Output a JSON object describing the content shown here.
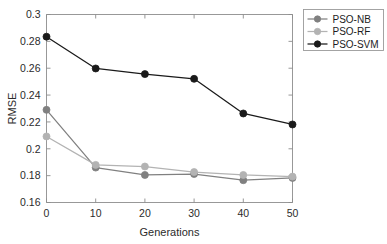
{
  "chart_data": {
    "type": "line",
    "title": "",
    "xlabel": "Generations",
    "ylabel": "RMSE",
    "x": [
      0,
      10,
      20,
      30,
      40,
      50
    ],
    "xlim": [
      0,
      50
    ],
    "ylim": [
      0.16,
      0.3
    ],
    "xticks": [
      0,
      10,
      20,
      30,
      40,
      50
    ],
    "xticklabels": [
      "0",
      "10",
      "20",
      "30",
      "40",
      "50"
    ],
    "yticks": [
      0.16,
      0.18,
      0.2,
      0.22,
      0.24,
      0.26,
      0.28,
      0.3
    ],
    "yticklabels": [
      "0.16",
      "0.18",
      "0.2",
      "0.22",
      "0.24",
      "0.26",
      "0.28",
      "0.3"
    ],
    "grid": false,
    "legend_position": "outside-top-right",
    "marker": "circle",
    "series": [
      {
        "name": "PSO-NB",
        "color": "#808080",
        "values": [
          0.229,
          0.186,
          0.1805,
          0.1812,
          0.1766,
          0.1783
        ]
      },
      {
        "name": "PSO-RF",
        "color": "#b3b3b3",
        "values": [
          0.2092,
          0.188,
          0.1868,
          0.1827,
          0.1805,
          0.1793
        ]
      },
      {
        "name": "PSO-SVM",
        "color": "#1a1a1a",
        "values": [
          0.2835,
          0.2598,
          0.2556,
          0.2521,
          0.2263,
          0.2181
        ]
      }
    ]
  },
  "legend": {
    "entries": [
      "PSO-NB",
      "PSO-RF",
      "PSO-SVM"
    ]
  },
  "axes": {
    "x_title": "Generations",
    "y_title": "RMSE"
  }
}
